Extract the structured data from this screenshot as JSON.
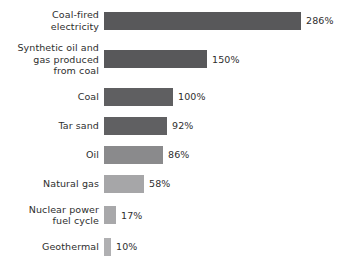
{
  "chart_data": {
    "type": "bar",
    "orientation": "horizontal",
    "title": "",
    "subtitle": "",
    "xlabel": "",
    "ylabel": "",
    "grid": false,
    "legend": false,
    "legend_position": "none",
    "axis_visible": false,
    "value_suffix": "%",
    "xlim": [
      0,
      286
    ],
    "categories": [
      "Coal-fired\nelectricity",
      "Synthetic oil and\ngas produced\nfrom coal",
      "Coal",
      "Tar sand",
      "Oil",
      "Natural gas",
      "Nuclear power\nfuel cycle",
      "Geothermal"
    ],
    "values": [
      286,
      150,
      100,
      92,
      86,
      58,
      17,
      10
    ],
    "value_labels": [
      "286%",
      "150%",
      "100%",
      "92%",
      "86%",
      "58%",
      "17%",
      "10%"
    ],
    "bar_colors": [
      "#58585a",
      "#58585a",
      "#5f5f61",
      "#606062",
      "#8a8a8c",
      "#a6a6a8",
      "#a8a8aa",
      "#b0b0b2"
    ],
    "background_color": "#ffffff",
    "text_color": "#2e2e2e"
  },
  "layout": {
    "bar_origin_px": 108,
    "px_per_percent": 0.69,
    "bar_height_px": 18
  }
}
